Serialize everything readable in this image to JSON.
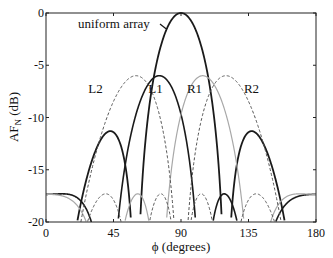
{
  "chart_data": {
    "type": "line",
    "title": "",
    "xlabel": "ϕ (degrees)",
    "ylabel": "AF",
    "ylabel_sub": "N",
    "ylabel_unit": " (dB)",
    "xlim": [
      0,
      180
    ],
    "ylim": [
      -20,
      0
    ],
    "xticks": [
      0,
      45,
      90,
      135,
      180
    ],
    "yticks": [
      0,
      -5,
      -10,
      -15,
      -20
    ],
    "grid": false,
    "legend": "inline labels",
    "series": [
      {
        "name": "uniform array",
        "style": "solid",
        "color": "#1a1a1a",
        "width": 1.8,
        "peak_phi": 90,
        "peak_db": 0,
        "N": 4,
        "beam_shift": 0
      },
      {
        "name": "L1",
        "style": "solid",
        "color": "#1a1a1a",
        "width": 1.6,
        "peak_phi": 72,
        "peak_db": -6,
        "N": 4,
        "beam_shift": -1
      },
      {
        "name": "R1",
        "style": "solid",
        "color": "#a8a8a8",
        "width": 1.2,
        "peak_phi": 108,
        "peak_db": -6,
        "N": 4,
        "beam_shift": 1
      },
      {
        "name": "L2",
        "style": "dashed",
        "color": "#555555",
        "width": 1.0,
        "peak_phi": 43,
        "peak_db": -6,
        "N": 4,
        "beam_shift": -2
      },
      {
        "name": "R2",
        "style": "dashed",
        "color": "#555555",
        "width": 1.0,
        "peak_phi": 137,
        "peak_db": -6,
        "N": 4,
        "beam_shift": 2
      }
    ],
    "annotations": [
      {
        "text": "uniform array",
        "x_px": 78,
        "y_px": 28,
        "arrow_to_phi": 80,
        "arrow_to_db": -1.5
      },
      {
        "text": "L2",
        "phi": 33,
        "db": -7.7
      },
      {
        "text": "L1",
        "phi": 73,
        "db": -7.7
      },
      {
        "text": "R1",
        "phi": 99,
        "db": -7.7
      },
      {
        "text": "R2",
        "phi": 137,
        "db": -7.7
      }
    ]
  }
}
